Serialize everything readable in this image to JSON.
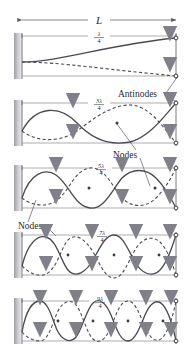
{
  "figure": {
    "title_label": "L",
    "colors": {
      "wave_solid": "#4a4a52",
      "wave_dashed": "#4a4a52",
      "arrow": "#8a8a92",
      "wall": "#b8b8bc",
      "dimension_line": "#6b6b72",
      "node_dot": "#3a3a42",
      "text": "#2b2b2b",
      "background": "#ffffff"
    },
    "dimension": {
      "label": "L",
      "left_tick": "|",
      "right_tick": "|"
    },
    "annotations": [
      {
        "name": "antinodes",
        "text": "Antinodes",
        "x": 118,
        "y": 97
      },
      {
        "name": "nodes-upper",
        "text": "Nodes",
        "x": 113,
        "y": 156
      },
      {
        "name": "nodes-lower",
        "text": "Nodes",
        "x": 18,
        "y": 229
      }
    ],
    "panels": [
      {
        "id": "panel-1",
        "harmonic_index": 1,
        "wavelength_numerator": "λ",
        "wavelength_coefficient": "",
        "wavelength_denominator": "4",
        "label_text": "λ/4",
        "quarter_wavelengths": 1,
        "antinode_arrow_count": 1,
        "node_count": 0
      },
      {
        "id": "panel-2",
        "harmonic_index": 3,
        "wavelength_numerator": "3λ",
        "wavelength_coefficient": "3",
        "wavelength_denominator": "4",
        "label_text": "3λ/4",
        "quarter_wavelengths": 3,
        "antinode_arrow_count": 2,
        "node_count": 1
      },
      {
        "id": "panel-3",
        "harmonic_index": 5,
        "wavelength_numerator": "5λ",
        "wavelength_coefficient": "5",
        "wavelength_denominator": "4",
        "label_text": "5λ/4",
        "quarter_wavelengths": 5,
        "antinode_arrow_count": 3,
        "node_count": 2
      },
      {
        "id": "panel-4",
        "harmonic_index": 7,
        "wavelength_numerator": "7λ",
        "wavelength_coefficient": "7",
        "wavelength_denominator": "4",
        "label_text": "7λ/4",
        "quarter_wavelengths": 7,
        "antinode_arrow_count": 4,
        "node_count": 3
      },
      {
        "id": "panel-5",
        "harmonic_index": 9,
        "wavelength_numerator": "9λ",
        "wavelength_coefficient": "9",
        "wavelength_denominator": "4",
        "label_text": "9λ/4",
        "quarter_wavelengths": 9,
        "antinode_arrow_count": 5,
        "node_count": 4
      }
    ]
  }
}
